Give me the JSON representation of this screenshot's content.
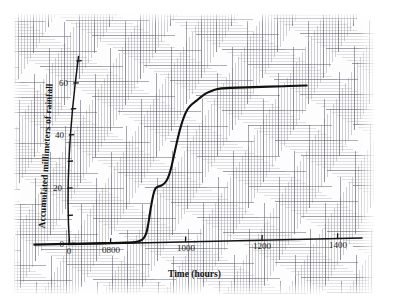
{
  "chart_data": {
    "type": "line",
    "title": "",
    "subtitle": "",
    "xlabel": "Time (hours)",
    "ylabel": "Accumulated millimeters of rainfall",
    "xlim": [
      600,
      1460
    ],
    "ylim": [
      0,
      72
    ],
    "grid": true,
    "grid_style": "engineering graph paper, fine and coarse rulings",
    "legend": "none",
    "x_tick_labels": [
      "0",
      "0800",
      "1000",
      "1200",
      "1400"
    ],
    "x_tick_values": [
      600,
      800,
      1000,
      1200,
      1400
    ],
    "y_tick_labels": [
      "0",
      "20",
      "40",
      "60"
    ],
    "y_tick_values": [
      0,
      20,
      40,
      60
    ],
    "y_minor_tick_values": [
      10,
      30,
      50,
      70
    ],
    "series": [
      {
        "name": "Accumulated rainfall",
        "color": "#111111",
        "points": [
          [
            600,
            0.0
          ],
          [
            700,
            0.0
          ],
          [
            780,
            0.0
          ],
          [
            840,
            0.0
          ],
          [
            870,
            0.2
          ],
          [
            885,
            1.0
          ],
          [
            895,
            3.0
          ],
          [
            902,
            7.5
          ],
          [
            908,
            13.0
          ],
          [
            915,
            18.0
          ],
          [
            920,
            20.0
          ],
          [
            928,
            20.8
          ],
          [
            938,
            21.3
          ],
          [
            948,
            22.6
          ],
          [
            956,
            25.0
          ],
          [
            963,
            28.5
          ],
          [
            970,
            33.0
          ],
          [
            978,
            38.0
          ],
          [
            986,
            42.5
          ],
          [
            995,
            46.5
          ],
          [
            1005,
            49.5
          ],
          [
            1015,
            51.2
          ],
          [
            1028,
            52.6
          ],
          [
            1040,
            54.0
          ],
          [
            1055,
            55.4
          ],
          [
            1072,
            56.4
          ],
          [
            1090,
            57.0
          ],
          [
            1120,
            57.2
          ],
          [
            1180,
            57.3
          ],
          [
            1260,
            57.4
          ],
          [
            1320,
            57.5
          ]
        ]
      }
    ],
    "annotations": [
      "Curve is flat at 0 mm until roughly 0850 h",
      "Steep first burst of rain between about 0890 h and 0920 h reaching 20 mm",
      "Brief shelf (little rain) near 20 mm around 0920-0945 h",
      "Main heavy burst from about 0950 h to 1010 h rising to roughly 49 mm",
      "Rain tapers off and accumulation plateaus near 57 mm after about 1100 h"
    ]
  },
  "axes": {
    "x_title": "Time (hours)",
    "y_title": "Accumulated millimeters of rainfall"
  },
  "ticks": {
    "x": [
      {
        "label": "0",
        "px": 69
      },
      {
        "label": "0800",
        "px": 110
      },
      {
        "label": "1000",
        "px": 185
      },
      {
        "label": "1200",
        "px": 262
      },
      {
        "label": "1400",
        "px": 337
      }
    ],
    "y": [
      {
        "label": "0",
        "px": 243
      },
      {
        "label": "20",
        "px": 188
      },
      {
        "label": "40",
        "px": 135
      },
      {
        "label": "60",
        "px": 83
      }
    ]
  },
  "colors": {
    "curve": "#111111",
    "axis": "#141414",
    "grid_fine": "#787882",
    "grid_coarse": "#5f5f6e",
    "paper": "#fdfdfd",
    "page": "#ffffff"
  }
}
